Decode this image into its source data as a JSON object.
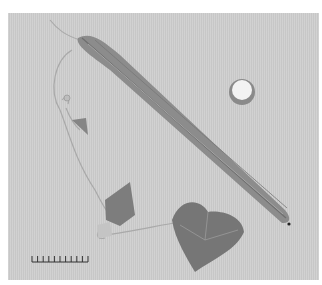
{
  "image": {
    "subject": "ridged gourd (luffa) with cross-section slice, vine, tendrils and leaves",
    "background_color": "#cfcfcf",
    "border_color": "#ffffff",
    "scale_bar": {
      "ticks": 11
    }
  },
  "colors": {
    "gourd": "#8c8c8c",
    "gourd_dark": "#707070",
    "leaf": "#7a7a7a",
    "slice_inner": "#f2f2f2",
    "slice_rim": "#8a8a8a",
    "vine": "#a8a8a8"
  }
}
